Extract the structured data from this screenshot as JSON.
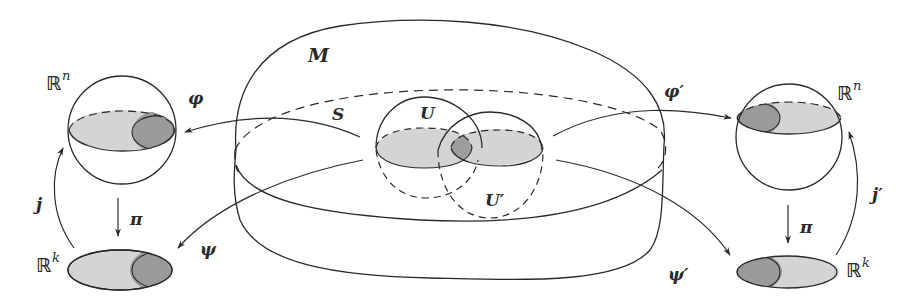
{
  "diagram": {
    "colors": {
      "stroke": "#2a2a2a",
      "light_fill": "#d4d4d4",
      "dark_fill": "#9a9a9a",
      "background": "#ffffff"
    },
    "labels": {
      "manifold": "M",
      "submanifold": "S",
      "chart_u": "U",
      "chart_u_prime": "U′",
      "left_rn_base": "ℝ",
      "left_rn_exp": "n",
      "left_rk_base": "ℝ",
      "left_rk_exp": "k",
      "right_rn_base": "ℝ",
      "right_rn_exp": "n",
      "right_rk_base": "ℝ",
      "right_rk_exp": "k",
      "phi": "φ",
      "phi_prime": "φ′",
      "psi": "ψ",
      "psi_prime": "ψ′",
      "j": "j",
      "j_prime": "j′",
      "pi_left": "π",
      "pi_right": "π"
    },
    "nodes": [
      {
        "id": "M",
        "label": "M",
        "type": "manifold"
      },
      {
        "id": "S",
        "label": "S",
        "type": "submanifold (dashed)"
      },
      {
        "id": "U",
        "label": "U",
        "type": "chart domain"
      },
      {
        "id": "U'",
        "label": "U′",
        "type": "chart domain"
      },
      {
        "id": "Rn_left",
        "label": "ℝⁿ",
        "type": "sphere"
      },
      {
        "id": "Rk_left",
        "label": "ℝᵏ",
        "type": "disk"
      },
      {
        "id": "Rn_right",
        "label": "ℝⁿ",
        "type": "sphere"
      },
      {
        "id": "Rk_right",
        "label": "ℝᵏ",
        "type": "disk"
      }
    ],
    "edges": [
      {
        "from": "U",
        "to": "Rn_left",
        "label": "φ"
      },
      {
        "from": "U",
        "to": "Rk_left",
        "label": "ψ"
      },
      {
        "from": "Rn_left",
        "to": "Rk_left",
        "label": "π"
      },
      {
        "from": "Rk_left",
        "to": "Rn_left",
        "label": "j"
      },
      {
        "from": "U'",
        "to": "Rn_right",
        "label": "φ′"
      },
      {
        "from": "U'",
        "to": "Rk_right",
        "label": "ψ′"
      },
      {
        "from": "Rn_right",
        "to": "Rk_right",
        "label": "π"
      },
      {
        "from": "Rk_right",
        "to": "Rn_right",
        "label": "j′"
      }
    ]
  }
}
